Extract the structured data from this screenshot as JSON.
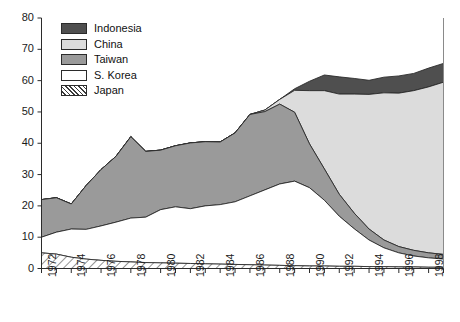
{
  "chart_data": {
    "type": "area",
    "stacked": true,
    "title": "",
    "xlabel": "",
    "ylabel": "",
    "xlim": [
      1972,
      1999
    ],
    "ylim": [
      0,
      80
    ],
    "yticks": [
      0,
      10,
      20,
      30,
      40,
      50,
      60,
      70,
      80
    ],
    "xticks": [
      1972,
      1974,
      1976,
      1978,
      1980,
      1982,
      1984,
      1986,
      1988,
      1990,
      1992,
      1994,
      1996,
      1998
    ],
    "xtick_labels": [
      "1972",
      "1974",
      "1976",
      "1978",
      "1980",
      "1982",
      "1984",
      "1986",
      "1988",
      "1990",
      "1992",
      "1994",
      "1996",
      "1998"
    ],
    "ytick_labels": [
      "0",
      "10",
      "20",
      "30",
      "40",
      "50",
      "60",
      "70",
      "80"
    ],
    "grid": false,
    "legend_position": "top-left",
    "x": [
      1972,
      1973,
      1974,
      1975,
      1976,
      1977,
      1978,
      1979,
      1980,
      1981,
      1982,
      1983,
      1984,
      1985,
      1986,
      1987,
      1988,
      1989,
      1990,
      1991,
      1992,
      1993,
      1994,
      1995,
      1996,
      1997,
      1998,
      1999
    ],
    "series": [
      {
        "name": "Japan",
        "fill": "hatch",
        "values": [
          5.0,
          4.6,
          3.6,
          3.0,
          2.6,
          2.3,
          2.1,
          1.9,
          1.8,
          1.7,
          1.6,
          1.5,
          1.4,
          1.3,
          1.2,
          1.1,
          1.0,
          0.9,
          0.8,
          0.8,
          0.7,
          0.7,
          0.6,
          0.6,
          0.5,
          0.5,
          0.4,
          0.4
        ]
      },
      {
        "name": "S. Korea",
        "fill": "#ffffff",
        "values": [
          5.0,
          7.0,
          9.0,
          9.5,
          11.0,
          12.5,
          14.0,
          14.5,
          17.0,
          18.0,
          17.5,
          18.5,
          19.0,
          20.0,
          22.0,
          24.0,
          26.0,
          27.0,
          25.0,
          21.0,
          16.0,
          12.0,
          8.5,
          6.0,
          4.5,
          3.5,
          3.0,
          2.6
        ]
      },
      {
        "name": "Taiwan",
        "fill": "#9a9a9a",
        "values": [
          12.0,
          11.0,
          8.0,
          14.0,
          18.0,
          21.0,
          26.0,
          21.0,
          19.0,
          19.5,
          21.0,
          20.5,
          20.0,
          22.0,
          26.0,
          25.0,
          25.5,
          22.0,
          14.0,
          10.0,
          7.0,
          5.0,
          3.5,
          2.5,
          2.0,
          1.8,
          1.6,
          1.5
        ]
      },
      {
        "name": "China",
        "fill": "#dcdcdc",
        "values": [
          0,
          0,
          0,
          0,
          0,
          0,
          0,
          0,
          0,
          0,
          0,
          0,
          0,
          0,
          0,
          0.5,
          1.5,
          7.0,
          17.0,
          25.0,
          32.0,
          38.0,
          43.0,
          47.0,
          49.0,
          51.0,
          53.0,
          55.0
        ]
      },
      {
        "name": "Indonesia",
        "fill": "#4f4f4f",
        "values": [
          0,
          0,
          0,
          0,
          0,
          0,
          0,
          0,
          0,
          0,
          0,
          0,
          0,
          0,
          0,
          0,
          0,
          0.5,
          3.0,
          5.0,
          5.5,
          5.0,
          4.5,
          5.0,
          5.5,
          5.5,
          6.0,
          6.0
        ]
      }
    ]
  },
  "legend": {
    "items": [
      {
        "label": "Indonesia",
        "color": "#4f4f4f",
        "pattern": "solid"
      },
      {
        "label": "China",
        "color": "#dcdcdc",
        "pattern": "solid"
      },
      {
        "label": "Taiwan",
        "color": "#9a9a9a",
        "pattern": "solid"
      },
      {
        "label": "S. Korea",
        "color": "#ffffff",
        "pattern": "solid"
      },
      {
        "label": "Japan",
        "color": "#ffffff",
        "pattern": "hatch"
      }
    ]
  },
  "caption": {
    "text": ""
  }
}
